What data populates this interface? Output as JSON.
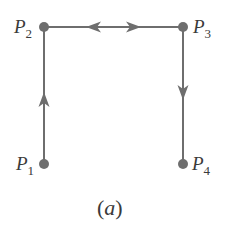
{
  "colors": {
    "edge": "#6e6e6e",
    "node": "#6e6e6e",
    "text": "#3a3a3a",
    "background": "#ffffff"
  },
  "nodes": [
    {
      "id": "P1",
      "label_main": "P",
      "label_sub": "1",
      "x": 44,
      "y": 164,
      "label_side": "left"
    },
    {
      "id": "P2",
      "label_main": "P",
      "label_sub": "2",
      "x": 44,
      "y": 27,
      "label_side": "left"
    },
    {
      "id": "P3",
      "label_main": "P",
      "label_sub": "3",
      "x": 183,
      "y": 27,
      "label_side": "right"
    },
    {
      "id": "P4",
      "label_main": "P",
      "label_sub": "4",
      "x": 183,
      "y": 164,
      "label_side": "right"
    }
  ],
  "edges": [
    {
      "from": "P1",
      "to": "P2",
      "direction": "forward",
      "arrow": "up"
    },
    {
      "from": "P2",
      "to": "P3",
      "direction": "bidirectional",
      "arrow": "left-and-right"
    },
    {
      "from": "P3",
      "to": "P4",
      "direction": "forward",
      "arrow": "down"
    }
  ],
  "caption": {
    "open": "(",
    "letter": "a",
    "close": ")"
  }
}
